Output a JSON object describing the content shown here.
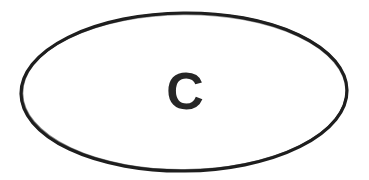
{
  "canvas": {
    "width": 369,
    "height": 180,
    "background_color": "#ffffff",
    "description": "scanned-line-drawing"
  },
  "figure": {
    "name": "labeled-ellipse",
    "shape": {
      "type": "ellipse",
      "center_x": 184,
      "center_y": 92,
      "radius_x": 163,
      "radius_y": 79,
      "rotation_deg": -0.6,
      "stroke_color": "#1f1f1f",
      "stroke_width": 3.2,
      "fill_color": "#ffffff"
    },
    "label": {
      "text": "C",
      "center_x": 185,
      "center_y": 91,
      "font_size": 52,
      "font_weight": "bold",
      "color": "#262626"
    }
  }
}
